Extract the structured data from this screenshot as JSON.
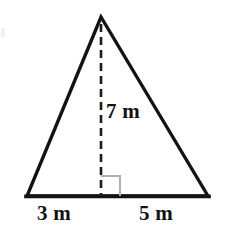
{
  "figure": {
    "type": "triangle-with-altitude",
    "colors": {
      "background": "#ffffff",
      "stroke": "#131313",
      "dashed_stroke": "#1c1c1c",
      "right_angle_marker": "#b0b0b0",
      "text": "#131313"
    },
    "geometry": {
      "apex": [
        101,
        17
      ],
      "bottom_left": [
        27,
        196
      ],
      "bottom_right": [
        208,
        196
      ],
      "altitude_foot": [
        101,
        196
      ],
      "stroke_width": 3.4,
      "dash_pattern": "8 5",
      "right_angle_marker_size": 19
    },
    "labels": {
      "height": "7 m",
      "base_left_segment": "3 m",
      "base_right_segment": "5 m"
    }
  }
}
